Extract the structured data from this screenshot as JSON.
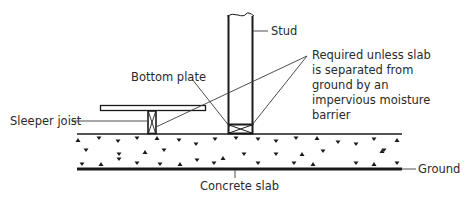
{
  "diagram": {
    "labels": {
      "stud": "Stud",
      "bottom_plate": "Bottom plate",
      "sleeper_joist": "Sleeper joist",
      "concrete_slab": "Concrete slab",
      "ground": "Ground",
      "note_line1": "Required unless slab",
      "note_line2": "is separated from",
      "note_line3": "ground by an",
      "note_line4": "impervious moisture",
      "note_line5": "barrier"
    },
    "colors": {
      "line": "#1a1a1a",
      "leader": "#3a3a3a",
      "background": "#ffffff"
    }
  }
}
